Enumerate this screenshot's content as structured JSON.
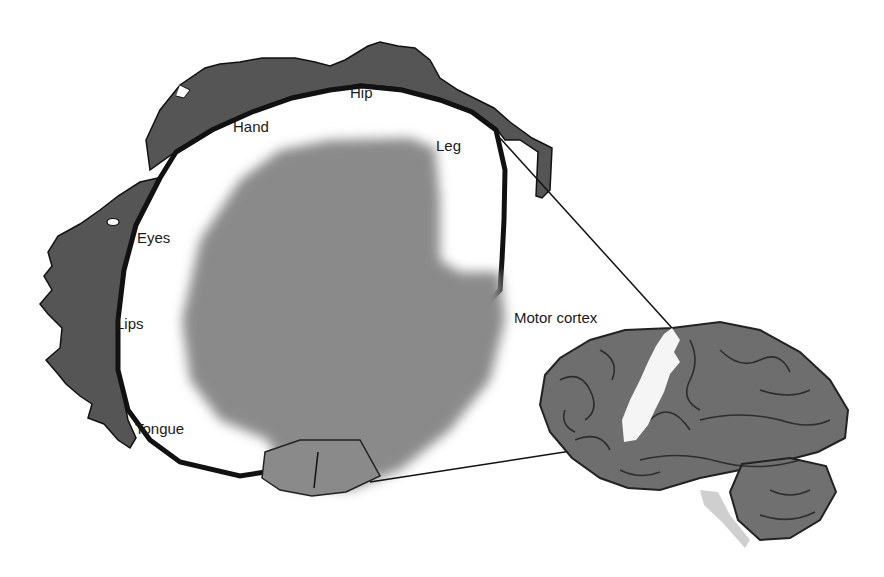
{
  "diagram": {
    "labels": {
      "hip": "Hip",
      "hand": "Hand",
      "leg": "Leg",
      "eyes": "Eyes",
      "lips": "Lips",
      "tongue": "Tongue",
      "motor_cortex": "Motor cortex"
    },
    "colors": {
      "background": "#ffffff",
      "homunculus_body": "#555555",
      "cortex_section": "#8a8a8a",
      "cortex_outline": "#111111",
      "brain": "#6e6e6e",
      "motor_strip": "#f5f5f5"
    }
  }
}
